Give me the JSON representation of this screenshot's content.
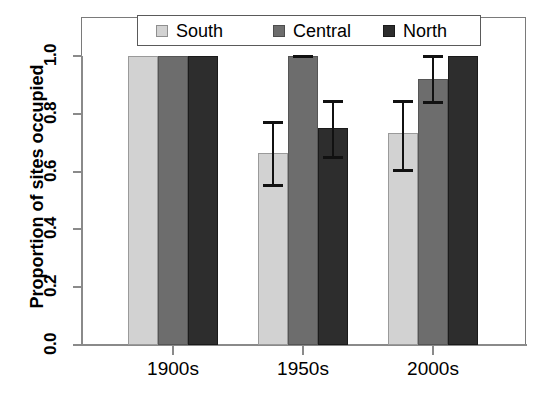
{
  "chart_data": {
    "type": "bar",
    "title": "",
    "xlabel": "",
    "ylabel": "Proportion of sites occupied",
    "categories": [
      "1900s",
      "1950s",
      "2000s"
    ],
    "ylim": [
      0.0,
      1.04
    ],
    "yticks": [
      "0.0",
      "0.2",
      "0.4",
      "0.6",
      "0.8",
      "1.0"
    ],
    "ytick_values": [
      0.0,
      0.2,
      0.4,
      0.6,
      0.8,
      1.0
    ],
    "grid": false,
    "legend_position": "top",
    "errorbars": true,
    "series": [
      {
        "name": "South",
        "color": "#d2d2d2",
        "values": [
          1.0,
          0.665,
          0.733
        ],
        "err_low": [
          null,
          0.554,
          0.605
        ],
        "err_high": [
          null,
          0.772,
          0.845
        ]
      },
      {
        "name": "Central",
        "color": "#6d6d6d",
        "values": [
          1.0,
          1.0,
          0.92
        ],
        "err_low": [
          null,
          1.0,
          0.84
        ],
        "err_high": [
          null,
          1.0,
          1.0
        ]
      },
      {
        "name": "North",
        "color": "#2d2d2d",
        "values": [
          1.0,
          0.75,
          1.0
        ],
        "err_low": [
          null,
          0.65,
          null
        ],
        "err_high": [
          null,
          0.845,
          null
        ]
      }
    ]
  },
  "legend": {
    "items": [
      {
        "label": "South"
      },
      {
        "label": "Central"
      },
      {
        "label": "North"
      }
    ]
  },
  "axes": {
    "y_title": "Proportion of sites occupied",
    "y_labels": [
      "0.0",
      "0.2",
      "0.4",
      "0.6",
      "0.8",
      "1.0"
    ],
    "x_labels": [
      "1900s",
      "1950s",
      "2000s"
    ]
  }
}
